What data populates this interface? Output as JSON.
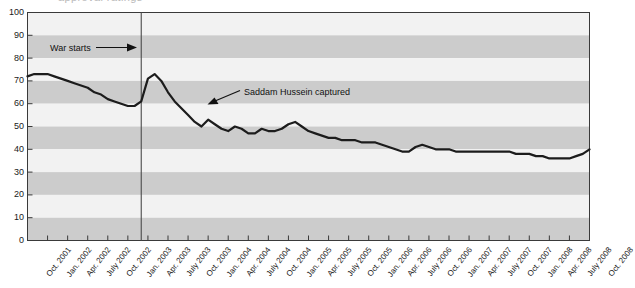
{
  "figure": {
    "title_fragment": "approval ratings",
    "background_color": "#ffffff",
    "plot_border_color": "#3a3a3a"
  },
  "annotations": {
    "war_starts": {
      "label": "War starts",
      "x_value": "Mar. 2003",
      "marker": "vertical-line"
    },
    "saddam_captured": {
      "label": "Saddam Hussein captured",
      "x_value": "Dec. 2003",
      "marker": "arrow"
    }
  },
  "chart_data": {
    "type": "line",
    "title": "",
    "subtitle": "",
    "xlabel": "",
    "ylabel": "",
    "ylim": [
      0,
      100
    ],
    "ytick_step": 10,
    "yticks": [
      100,
      90,
      80,
      70,
      60,
      50,
      40,
      30,
      20,
      10,
      0
    ],
    "grid": "horizontal-alternating-bands",
    "band_colors": [
      "#f2f2f2",
      "#cccccc"
    ],
    "legend_position": "none",
    "line_color": "#1c1c1c",
    "line_width": 2.2,
    "x_tick_labels": [
      "Oct. 2001",
      "Jan. 2002",
      "Apr. 2002",
      "July 2002",
      "Oct. 2002",
      "Jan. 2003",
      "Apr. 2003",
      "July 2003",
      "Oct. 2003",
      "Jan. 2004",
      "Apr. 2004",
      "July 2004",
      "Oct. 2004",
      "Jan. 2005",
      "Apr. 2005",
      "July 2005",
      "Oct. 2005",
      "Jan. 2006",
      "Apr. 2006",
      "July 2006",
      "Oct. 2006",
      "Jan. 2007",
      "Apr. 2007",
      "July 2007",
      "Oct. 2007",
      "Jan. 2008",
      "Apr. 2008",
      "July 2008",
      "Oct. 2008"
    ],
    "x": [
      "Oct. 2001",
      "Nov. 2001",
      "Dec. 2001",
      "Jan. 2002",
      "Feb. 2002",
      "Mar. 2002",
      "Apr. 2002",
      "May 2002",
      "June 2002",
      "July 2002",
      "Aug. 2002",
      "Sep. 2002",
      "Oct. 2002",
      "Nov. 2002",
      "Dec. 2002",
      "Jan. 2003",
      "Feb. 2003",
      "Mar. 2003",
      "Apr. 2003",
      "May 2003",
      "June 2003",
      "July 2003",
      "Aug. 2003",
      "Sep. 2003",
      "Oct. 2003",
      "Nov. 2003",
      "Dec. 2003",
      "Jan. 2004",
      "Feb. 2004",
      "Mar. 2004",
      "Apr. 2004",
      "May 2004",
      "June 2004",
      "July 2004",
      "Aug. 2004",
      "Sep. 2004",
      "Oct. 2004",
      "Nov. 2004",
      "Dec. 2004",
      "Jan. 2005",
      "Feb. 2005",
      "Mar. 2005",
      "Apr. 2005",
      "May 2005",
      "June 2005",
      "July 2005",
      "Aug. 2005",
      "Sep. 2005",
      "Oct. 2005",
      "Nov. 2005",
      "Dec. 2005",
      "Jan. 2006",
      "Feb. 2006",
      "Mar. 2006",
      "Apr. 2006",
      "May 2006",
      "June 2006",
      "July 2006",
      "Aug. 2006",
      "Sep. 2006",
      "Oct. 2006",
      "Nov. 2006",
      "Dec. 2006",
      "Jan. 2007",
      "Feb. 2007",
      "Mar. 2007",
      "Apr. 2007",
      "May 2007",
      "June 2007",
      "July 2007",
      "Aug. 2007",
      "Sep. 2007",
      "Oct. 2007",
      "Nov. 2007",
      "Dec. 2007",
      "Jan. 2008",
      "Feb. 2008",
      "Mar. 2008",
      "Apr. 2008",
      "May 2008",
      "June 2008",
      "July 2008",
      "Aug. 2008",
      "Sep. 2008",
      "Oct. 2008"
    ],
    "series": [
      {
        "name": "Presidential approval",
        "values": [
          72,
          73,
          73,
          73,
          72,
          71,
          70,
          69,
          68,
          67,
          65,
          64,
          62,
          61,
          60,
          59,
          59,
          61,
          71,
          73,
          70,
          65,
          61,
          58,
          55,
          52,
          50,
          53,
          51,
          49,
          48,
          50,
          49,
          47,
          47,
          49,
          48,
          48,
          49,
          51,
          52,
          50,
          48,
          47,
          46,
          45,
          45,
          44,
          44,
          44,
          43,
          43,
          43,
          42,
          41,
          40,
          39,
          39,
          41,
          42,
          41,
          40,
          40,
          40,
          39,
          39,
          39,
          39,
          39,
          39,
          39,
          39,
          39,
          38,
          38,
          38,
          37,
          37,
          36,
          36,
          36,
          36,
          37,
          38,
          40
        ]
      }
    ]
  }
}
